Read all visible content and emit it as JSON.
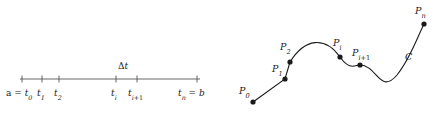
{
  "figure": {
    "width": 445,
    "height": 117,
    "background": "#ffffff",
    "ink_color": "#222222",
    "axis_color": "#555555",
    "curve_color": "#1a1a1a",
    "dot_color": "#1a1a1a"
  },
  "partition": {
    "axis": {
      "x_start": 20,
      "x_end": 200,
      "y": 79,
      "tick_height": 7
    },
    "delta_label": {
      "text_delta": "Δ",
      "text_var": "t",
      "x": 118,
      "y": 62
    },
    "ticks": [
      {
        "id": "t0",
        "x": 22,
        "label_prefix": "a =",
        "label_base": "t",
        "label_sub": "0",
        "label_x": 6,
        "label_y": 89
      },
      {
        "id": "t1",
        "x": 42,
        "label_prefix": "",
        "label_base": "t",
        "label_sub": "1",
        "label_x": 37,
        "label_y": 89
      },
      {
        "id": "t2",
        "x": 59,
        "label_prefix": "",
        "label_base": "t",
        "label_sub": "2",
        "label_x": 54,
        "label_y": 89
      },
      {
        "id": "ti",
        "x": 116,
        "label_prefix": "",
        "label_base": "t",
        "label_sub": "i",
        "label_x": 111,
        "label_y": 89
      },
      {
        "id": "ti+1",
        "x": 137,
        "label_prefix": "",
        "label_base": "t",
        "label_sub": "i+1",
        "label_x": 128,
        "label_y": 89
      },
      {
        "id": "tn",
        "x": 197,
        "label_prefix": "",
        "label_base": "t",
        "label_sub": "n",
        "label_suffix": "= b",
        "label_x": 178,
        "label_y": 89
      }
    ],
    "labels": {
      "t0": "a = t₀",
      "t1": "t₁",
      "t2": "t₂",
      "ti": "tᵢ",
      "ti_plus_1": "tᵢ₊₁",
      "tn": "tₙ = b",
      "delta_t": "Δt"
    }
  },
  "curve": {
    "path": "M 28 102 L 60 79 L 65 62 C 80 38 100 36 115 57 C 125 71 130 65 135 65 C 152 65 155 95 172 75 C 185 59 192 38 199 24",
    "stroke_width": 1.1,
    "label_C": {
      "text": "C",
      "x": 180,
      "y": 52
    },
    "points": [
      {
        "id": "P0",
        "cx": 28,
        "cy": 102,
        "r": 2.6,
        "base": "P",
        "sub": "0",
        "label_x": 14,
        "label_y": 86
      },
      {
        "id": "P1",
        "cx": 60,
        "cy": 79,
        "r": 2.6,
        "base": "P",
        "sub": "1",
        "label_x": 47,
        "label_y": 64
      },
      {
        "id": "P2",
        "cx": 65,
        "cy": 62,
        "r": 2.6,
        "base": "P",
        "sub": "2",
        "label_x": 55,
        "label_y": 42
      },
      {
        "id": "Pi",
        "cx": 115,
        "cy": 57,
        "r": 2.6,
        "base": "P",
        "sub": "i",
        "label_x": 108,
        "label_y": 38
      },
      {
        "id": "Pi+1",
        "cx": 135,
        "cy": 65,
        "r": 2.6,
        "base": "P",
        "sub": "i+1",
        "label_x": 127,
        "label_y": 48
      },
      {
        "id": "Pn",
        "cx": 199,
        "cy": 24,
        "r": 2.6,
        "base": "P",
        "sub": "n",
        "label_x": 190,
        "label_y": 6
      }
    ],
    "labels": {
      "P0": "P₀",
      "P1": "P₁",
      "P2": "P₂",
      "Pi": "Pᵢ",
      "Pi_plus_1": "Pᵢ₊₁",
      "Pn": "Pₙ",
      "C": "C"
    }
  }
}
